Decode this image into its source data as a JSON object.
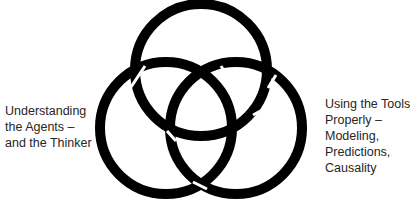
{
  "diagram": {
    "type": "borromean-rings",
    "ring_color": "#000000",
    "background": "#ffffff",
    "left_label": {
      "lines": [
        "Understanding",
        "the Agents –",
        "and the Thinker"
      ]
    },
    "right_label": {
      "lines": [
        "Using the Tools",
        "Properly –",
        "Modeling,",
        "Predictions,",
        "Causality"
      ]
    }
  }
}
